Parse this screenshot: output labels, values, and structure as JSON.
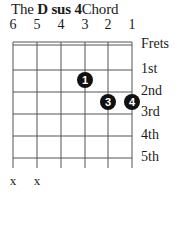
{
  "title": {
    "prefix": "The",
    "chord": "D sus 4",
    "suffix": "Chord"
  },
  "strings": [
    "6",
    "5",
    "4",
    "3",
    "2",
    "1"
  ],
  "frets_header": "Frets",
  "fret_labels": [
    "1st",
    "2nd",
    "3rd",
    "4th",
    "5th"
  ],
  "muted_strings": [
    "x",
    "x"
  ],
  "fingers": [
    {
      "finger": "1",
      "string": 3,
      "fret": 2
    },
    {
      "finger": "3",
      "string": 2,
      "fret": 3
    },
    {
      "finger": "4",
      "string": 1,
      "fret": 3
    }
  ],
  "colors": {
    "line": "#555555",
    "dot": "#111111"
  }
}
